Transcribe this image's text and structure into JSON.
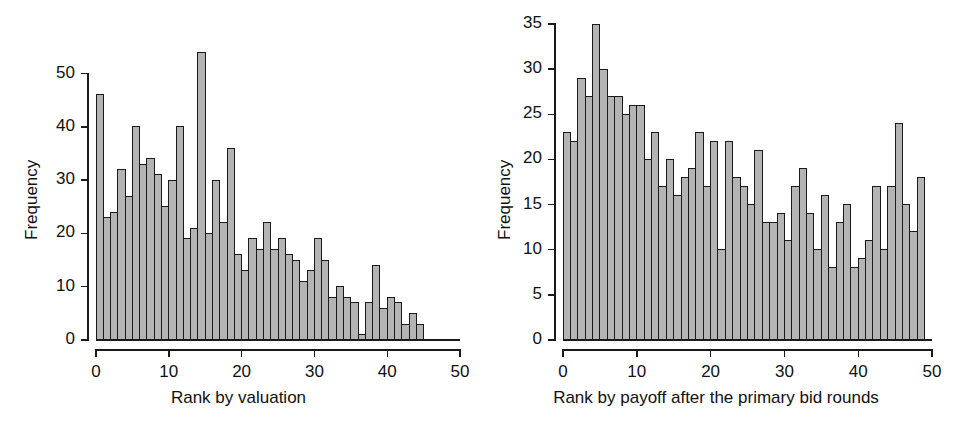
{
  "figure": {
    "background": "#ffffff",
    "bar_fill": "#b4b4b4",
    "bar_stroke": "#1a1a1a"
  },
  "chart_data": [
    {
      "type": "bar",
      "title": "",
      "xlabel": "Rank by valuation",
      "ylabel": "Frequency",
      "xlim": [
        0,
        50
      ],
      "ylim": [
        0,
        55
      ],
      "xticks": [
        0,
        10,
        20,
        30,
        40,
        50
      ],
      "xtick_labels": [
        "0",
        "10",
        "20",
        "30",
        "40",
        "50"
      ],
      "yticks": [
        0,
        10,
        20,
        30,
        40,
        50
      ],
      "ytick_labels": [
        "0",
        "10",
        "20",
        "30",
        "40",
        "50"
      ],
      "grid": false,
      "legend": "none",
      "categories": [
        0,
        1,
        2,
        3,
        4,
        5,
        6,
        7,
        8,
        9,
        10,
        11,
        12,
        13,
        14,
        15,
        16,
        17,
        18,
        19,
        20,
        21,
        22,
        23,
        24,
        25,
        26,
        27,
        28,
        29,
        30,
        31,
        32,
        33,
        34,
        35,
        36,
        37,
        38,
        39,
        40,
        41,
        42,
        43,
        44,
        45
      ],
      "values": [
        46,
        23,
        24,
        32,
        27,
        40,
        33,
        34,
        31,
        25,
        30,
        40,
        19,
        21,
        54,
        20,
        30,
        22,
        36,
        16,
        13,
        19,
        17,
        22,
        17,
        19,
        16,
        15,
        11,
        13,
        19,
        15,
        8,
        10,
        8,
        7,
        1,
        7,
        14,
        6,
        8,
        7,
        3,
        5,
        3,
        0
      ]
    },
    {
      "type": "bar",
      "title": "",
      "xlabel": "Rank by payoff after the primary bid rounds",
      "ylabel": "Frequency",
      "xlim": [
        0,
        50
      ],
      "ylim": [
        0,
        35
      ],
      "xticks": [
        0,
        10,
        20,
        30,
        40,
        50
      ],
      "xtick_labels": [
        "0",
        "10",
        "20",
        "30",
        "40",
        "50"
      ],
      "yticks": [
        0,
        5,
        10,
        15,
        20,
        25,
        30,
        35
      ],
      "ytick_labels": [
        "0",
        "5",
        "10",
        "15",
        "20",
        "25",
        "30",
        "35"
      ],
      "grid": false,
      "legend": "none",
      "categories": [
        0,
        1,
        2,
        3,
        4,
        5,
        6,
        7,
        8,
        9,
        10,
        11,
        12,
        13,
        14,
        15,
        16,
        17,
        18,
        19,
        20,
        21,
        22,
        23,
        24,
        25,
        26,
        27,
        28,
        29,
        30,
        31,
        32,
        33,
        34,
        35,
        36,
        37,
        38,
        39,
        40,
        41,
        42,
        43,
        44,
        45,
        46,
        47,
        48
      ],
      "values": [
        23,
        22,
        29,
        27,
        35,
        30,
        27,
        27,
        25,
        26,
        26,
        20,
        23,
        17,
        20,
        16,
        18,
        19,
        23,
        17,
        22,
        10,
        22,
        18,
        17,
        15,
        21,
        13,
        13,
        14,
        11,
        17,
        19,
        14,
        10,
        16,
        8,
        13,
        15,
        8,
        9,
        11,
        17,
        10,
        17,
        24,
        15,
        12,
        18
      ]
    }
  ]
}
